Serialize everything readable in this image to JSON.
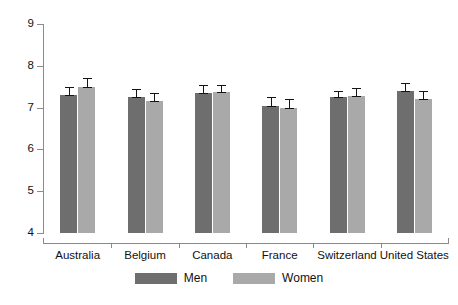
{
  "chart_data": {
    "type": "bar",
    "title": "",
    "subtitle": "",
    "xlabel": "",
    "ylabel": "",
    "categories": [
      "Australia",
      "Belgium",
      "Canada",
      "France",
      "Switzerland",
      "United States"
    ],
    "series": [
      {
        "name": "Men",
        "color": "#6e6e6e",
        "values": [
          7.3,
          7.25,
          7.35,
          7.05,
          7.25,
          7.4
        ],
        "errors": [
          0.2,
          0.2,
          0.18,
          0.2,
          0.15,
          0.2
        ]
      },
      {
        "name": "Women",
        "color": "#a9a9a9",
        "values": [
          7.5,
          7.15,
          7.38,
          7.0,
          7.28,
          7.2
        ],
        "errors": [
          0.22,
          0.2,
          0.17,
          0.2,
          0.18,
          0.2
        ]
      }
    ],
    "ylim": [
      4,
      9
    ],
    "yticks": [
      4,
      5,
      6,
      7,
      8,
      9
    ],
    "ytick_labels": [
      "4",
      "5",
      "6",
      "7",
      "8",
      "9"
    ],
    "grid": false,
    "legend_position": "bottom",
    "error_bar_type": "symmetric",
    "bar_baseline": 4
  },
  "legend": {
    "items": [
      {
        "label": "Men",
        "color": "#6e6e6e"
      },
      {
        "label": "Women",
        "color": "#a9a9a9"
      }
    ]
  },
  "colors": {
    "men": "#6e6e6e",
    "women": "#a9a9a9",
    "axis": "#8a8a8a",
    "error": "#141414",
    "background": "#ffffff",
    "text": "#111111"
  }
}
